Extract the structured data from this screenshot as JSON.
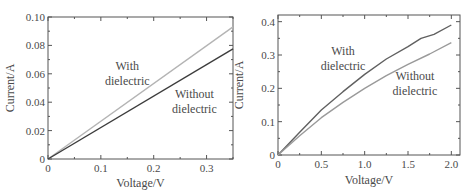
{
  "chart_data": [
    {
      "type": "line",
      "xlabel": "Voltage/V",
      "ylabel": "Current/A",
      "xlim": [
        0,
        0.35
      ],
      "ylim": [
        0,
        0.1
      ],
      "xticks": [
        0,
        0.1,
        0.2,
        0.3
      ],
      "xtick_labels": [
        "0",
        "0.1",
        "0.2",
        "0.3"
      ],
      "yticks": [
        0,
        0.02,
        0.04,
        0.06,
        0.08,
        0.1
      ],
      "ytick_labels": [
        "0",
        "0.02",
        "0.04",
        "0.06",
        "0.08",
        "0.10"
      ],
      "grid": false,
      "series": [
        {
          "name": "With dielectric",
          "color": "#b4b4b4",
          "x": [
            0,
            0.35
          ],
          "y": [
            0,
            0.093
          ]
        },
        {
          "name": "Without dielectric",
          "color": "#3c3c3c",
          "x": [
            0,
            0.35
          ],
          "y": [
            0,
            0.0775
          ]
        }
      ],
      "annotations": [
        {
          "lines": [
            "With",
            "dielectric"
          ],
          "x": 0.15,
          "y": 0.063
        },
        {
          "lines": [
            "Without",
            "dielectric"
          ],
          "x": 0.277,
          "y": 0.043
        }
      ]
    },
    {
      "type": "line",
      "xlabel": "Voltage/V",
      "ylabel": "Current/A",
      "xlim": [
        0,
        2.1
      ],
      "ylim": [
        0,
        0.42
      ],
      "xticks": [
        0,
        0.5,
        1.0,
        1.5,
        2.0
      ],
      "xtick_labels": [
        "0",
        "0.5",
        "1.0",
        "1.5",
        "2.0"
      ],
      "yticks": [
        0,
        0.1,
        0.2,
        0.3,
        0.4
      ],
      "ytick_labels": [
        "0",
        "0.1",
        "0.2",
        "0.3",
        "0.4"
      ],
      "grid": false,
      "series": [
        {
          "name": "With dielectric",
          "color": "#606060",
          "x": [
            0,
            0.25,
            0.5,
            0.75,
            1.0,
            1.25,
            1.5,
            1.65,
            1.8,
            2.0
          ],
          "y": [
            0,
            0.068,
            0.135,
            0.19,
            0.242,
            0.288,
            0.325,
            0.35,
            0.362,
            0.39
          ]
        },
        {
          "name": "Without dielectric",
          "color": "#9a9a9a",
          "x": [
            0,
            0.25,
            0.5,
            0.75,
            1.0,
            1.25,
            1.5,
            1.75,
            2.0
          ],
          "y": [
            0,
            0.058,
            0.112,
            0.158,
            0.2,
            0.238,
            0.272,
            0.303,
            0.337
          ]
        }
      ],
      "annotations": [
        {
          "lines": [
            "With",
            "dielectric"
          ],
          "x": 0.75,
          "y": 0.3
        },
        {
          "lines": [
            "Without",
            "dielectric"
          ],
          "x": 1.58,
          "y": 0.225
        }
      ]
    }
  ]
}
